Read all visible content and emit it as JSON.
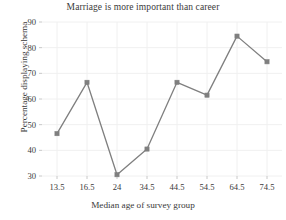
{
  "chart_data": {
    "type": "line",
    "title": "Marriage is more important than career",
    "xlabel": "Median age of survey group",
    "ylabel": "Percentage displaying schema",
    "categories": [
      "13.5",
      "16.5",
      "24",
      "34.5",
      "44.5",
      "54.5",
      "64.5",
      "74.5"
    ],
    "values": [
      46.5,
      66.5,
      30.5,
      40.5,
      66.5,
      61.5,
      84.5,
      74.5
    ],
    "x_tick_labels": [
      "13.5",
      "16.5",
      "24",
      "34.5",
      "44.5",
      "54.5",
      "64.5",
      "74.5"
    ],
    "y_tick_labels": [
      "30",
      "40",
      "50",
      "60",
      "70",
      "80",
      "90"
    ],
    "y_ticks": [
      30,
      40,
      50,
      60,
      70,
      80,
      90
    ],
    "ylim": [
      30,
      90
    ],
    "grid": true,
    "legend": "none",
    "series_color": "#7f7f7f",
    "marker": "square",
    "grid_color": "#f0f0f0"
  }
}
